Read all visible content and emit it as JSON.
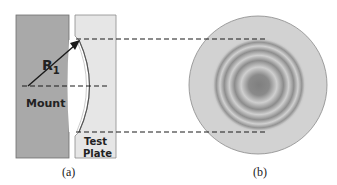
{
  "panel_a": {
    "caption": "(a)",
    "mount_label": "Mount",
    "plate_label_line1": "Test",
    "plate_label_line2": "Plate",
    "radius_label": "R",
    "radius_subscript": "1"
  },
  "panel_b": {
    "caption": "(b)"
  },
  "colors": {
    "mount_fill": "#a9a9a9",
    "plate_fill": "#e6e6e6",
    "disk_fill": "#d2d2d2",
    "fringe_dark": "#8a8a8a",
    "line": "#1a1a1a"
  }
}
